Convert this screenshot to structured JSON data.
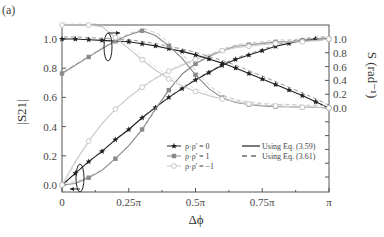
{
  "panel_label": "(a)",
  "chart_data": {
    "type": "line",
    "title": "",
    "xlabel": "Δϕ",
    "ylabel_left": "|S21|",
    "ylabel_right": "S (rad⁻¹)",
    "xlim": [
      0,
      1
    ],
    "x_unit": "π",
    "ylim_left": [
      0,
      1.0
    ],
    "ylim_right": [
      0,
      1.0
    ],
    "x_ticks": [
      0,
      0.25,
      0.5,
      0.75,
      1.0
    ],
    "x_tick_labels": [
      "0",
      "0.25π",
      "0.5π",
      "0.75π",
      "π"
    ],
    "y_ticks_left": [
      0.0,
      0.2,
      0.4,
      0.6,
      0.8,
      1.0
    ],
    "y_tick_labels_left": [
      "0.0",
      "0.2",
      "0.4",
      "0.6",
      "0.8",
      "1.0"
    ],
    "y_ticks_right": [
      0.0,
      0.2,
      0.4,
      0.6,
      0.8,
      1.0
    ],
    "y_tick_labels_right": [
      "0.0",
      "0.2",
      "0.4",
      "0.6",
      "0.8",
      "1.0"
    ],
    "grid": false,
    "legend_position": "lower right inside",
    "x": [
      0,
      0.05,
      0.1,
      0.15,
      0.2,
      0.25,
      0.3,
      0.35,
      0.4,
      0.45,
      0.5,
      0.55,
      0.6,
      0.65,
      0.7,
      0.75,
      0.8,
      0.85,
      0.9,
      0.95,
      1.0
    ],
    "series": [
      {
        "name": "ρ·ρ' = 0 (|S21|)",
        "axis": "left",
        "marker": "star",
        "color": "#222222",
        "values": [
          0.0,
          0.08,
          0.16,
          0.23,
          0.31,
          0.38,
          0.46,
          0.53,
          0.6,
          0.66,
          0.72,
          0.77,
          0.82,
          0.86,
          0.89,
          0.92,
          0.95,
          0.97,
          0.99,
          1.0,
          1.0
        ]
      },
      {
        "name": "ρ·ρ' = 1 (|S21|)",
        "axis": "left",
        "marker": "square",
        "color": "#8a8a8a",
        "values": [
          0.0,
          0.01,
          0.05,
          0.1,
          0.18,
          0.27,
          0.38,
          0.52,
          0.65,
          0.76,
          0.83,
          0.88,
          0.92,
          0.95,
          0.96,
          0.97,
          0.98,
          0.98,
          0.99,
          0.99,
          1.0
        ]
      },
      {
        "name": "ρ·ρ' = -1 (|S21|)",
        "axis": "left",
        "marker": "circle",
        "color": "#c8c8c8",
        "values": [
          0.0,
          0.16,
          0.3,
          0.42,
          0.52,
          0.6,
          0.67,
          0.73,
          0.78,
          0.82,
          0.86,
          0.89,
          0.92,
          0.94,
          0.95,
          0.96,
          0.97,
          0.98,
          0.98,
          0.99,
          1.0
        ]
      },
      {
        "name": "ρ·ρ' = 0 (S)",
        "axis": "right",
        "marker": "star",
        "color": "#222222",
        "values": [
          1.0,
          1.0,
          0.99,
          0.98,
          0.97,
          0.96,
          0.93,
          0.9,
          0.86,
          0.82,
          0.77,
          0.71,
          0.65,
          0.58,
          0.5,
          0.42,
          0.34,
          0.26,
          0.18,
          0.09,
          0.0
        ]
      },
      {
        "name": "ρ·ρ' = 1 (S)",
        "axis": "right",
        "marker": "square",
        "color": "#8a8a8a",
        "values": [
          0.5,
          0.62,
          0.74,
          0.86,
          0.97,
          1.06,
          1.12,
          1.05,
          0.9,
          0.72,
          0.48,
          0.28,
          0.15,
          0.08,
          0.05,
          0.03,
          0.02,
          0.02,
          0.01,
          0.01,
          0.0
        ]
      },
      {
        "name": "ρ·ρ' = -1 (S)",
        "axis": "right",
        "marker": "circle",
        "color": "#c8c8c8",
        "values": [
          1.45,
          1.42,
          1.32,
          1.18,
          1.02,
          0.86,
          0.7,
          0.55,
          0.42,
          0.32,
          0.24,
          0.18,
          0.13,
          0.09,
          0.06,
          0.04,
          0.03,
          0.02,
          0.01,
          0.01,
          0.0
        ]
      }
    ],
    "legend": [
      {
        "label": "ρ·ρ' = 0",
        "marker": "star",
        "color": "#222222"
      },
      {
        "label": "ρ·ρ' = 1",
        "marker": "square",
        "color": "#8a8a8a"
      },
      {
        "label": "ρ·ρ' = −1",
        "marker": "circle",
        "color": "#c8c8c8"
      },
      {
        "label": "Using Eq. (3.59)",
        "line": "solid"
      },
      {
        "label": "Using Eq. (3.61)",
        "line": "dashed"
      }
    ],
    "annotations": [
      "ellipse with arrow pointing right (S curves → right axis)",
      "ellipse with arrow pointing left (|S21| curves → left axis)"
    ]
  }
}
